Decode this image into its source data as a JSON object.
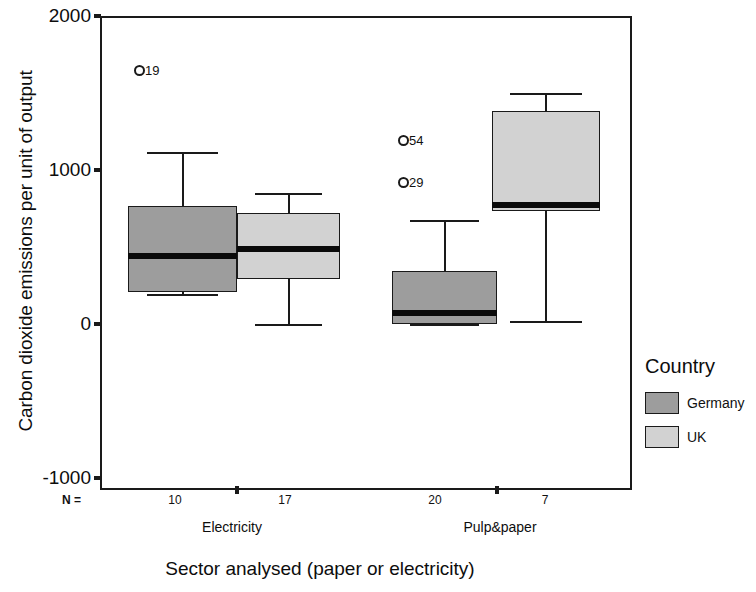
{
  "chart_data": {
    "type": "box",
    "title": "",
    "xlabel": "Sector analysed (paper or electricity)",
    "ylabel": "Carbon dioxide emissions per unit of output",
    "ylim": [
      -1000,
      2000
    ],
    "yticks": [
      2000,
      1000,
      0,
      -1000
    ],
    "ytick_labels": [
      "2000",
      "1000",
      "0",
      "-1000"
    ],
    "grid": false,
    "categories": [
      "Electricity",
      "Pulp&paper"
    ],
    "legend_position": "right",
    "legend_title": "Country",
    "n_label": "N =",
    "series": [
      {
        "name": "Germany",
        "color": "#9d9d9d",
        "boxes": [
          {
            "category": "Electricity",
            "n": 10,
            "whisker_low": 195,
            "q1": 210,
            "median": 440,
            "q3": 765,
            "whisker_high": 1120,
            "outliers": [
              {
                "label": "19",
                "value": 1665
              }
            ]
          },
          {
            "category": "Pulp&paper",
            "n": 20,
            "whisker_low": 0,
            "q1": 0,
            "median": 70,
            "q3": 345,
            "whisker_high": 675,
            "outliers": [
              {
                "label": "54",
                "value": 1210
              },
              {
                "label": "29",
                "value": 940
              }
            ]
          }
        ]
      },
      {
        "name": "UK",
        "color": "#d2d2d2",
        "boxes": [
          {
            "category": "Electricity",
            "n": 17,
            "whisker_low": 0,
            "q1": 290,
            "median": 485,
            "q3": 720,
            "whisker_high": 850,
            "outliers": []
          },
          {
            "category": "Pulp&paper",
            "n": 7,
            "whisker_low": 20,
            "q1": 735,
            "median": 775,
            "q3": 1385,
            "whisker_high": 1500,
            "outliers": []
          }
        ]
      }
    ]
  },
  "axes": {
    "y_title": "Carbon dioxide emissions per unit of output",
    "x_title": "Sector analysed (paper or electricity)",
    "y_tick_labels": [
      "2000",
      "1000",
      "0",
      "-1000"
    ]
  },
  "n_row": {
    "prefix": "N =",
    "values": [
      "10",
      "17",
      "20",
      "7"
    ]
  },
  "category_labels": [
    "Electricity",
    "Pulp&paper"
  ],
  "legend": {
    "title": "Country",
    "items": [
      {
        "label": "Germany",
        "color": "#9d9d9d"
      },
      {
        "label": "UK",
        "color": "#d2d2d2"
      }
    ]
  }
}
